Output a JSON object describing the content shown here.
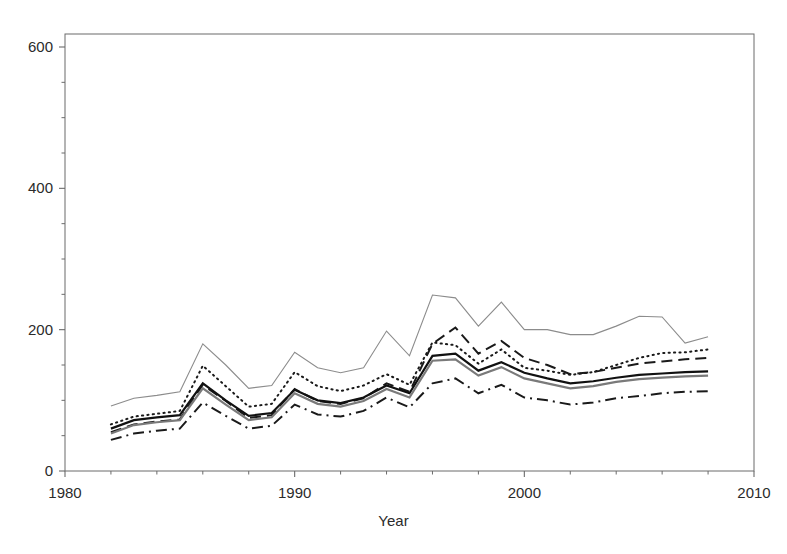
{
  "chart_data": {
    "type": "line",
    "title": "",
    "subtitle": "",
    "xlabel": "Year",
    "ylabel": "",
    "xlim": [
      1980,
      2010
    ],
    "ylim": [
      0,
      600
    ],
    "xticks": [
      1980,
      1990,
      2000,
      2010
    ],
    "xtick_labels": [
      "1980",
      "1990",
      "2000",
      "2010"
    ],
    "yticks": [
      0,
      200,
      400,
      600
    ],
    "ytick_labels": [
      "0",
      "200",
      "400",
      "600"
    ],
    "minor_ticks": true,
    "grid": false,
    "legend": "none",
    "x": [
      1982,
      1983,
      1984,
      1985,
      1986,
      1987,
      1988,
      1989,
      1990,
      1991,
      1992,
      1993,
      1994,
      1995,
      1996,
      1997,
      1998,
      1999,
      2000,
      2001,
      2002,
      2003,
      2004,
      2005,
      2006,
      2007,
      2008
    ],
    "series": [
      {
        "name": "series-1-thin-gray-solid",
        "style": "solid-thin-gray",
        "color": "#8c8c8c",
        "values": [
          92,
          103,
          107,
          112,
          180,
          150,
          117,
          121,
          168,
          146,
          139,
          146,
          198,
          163,
          249,
          245,
          205,
          239,
          200,
          200,
          193,
          193,
          205,
          219,
          218,
          181,
          190
        ]
      },
      {
        "name": "series-2-dotted",
        "style": "dotted",
        "color": "#1a1a1a",
        "values": [
          66,
          77,
          81,
          85,
          149,
          120,
          91,
          95,
          140,
          120,
          113,
          121,
          137,
          122,
          182,
          178,
          152,
          172,
          146,
          142,
          136,
          140,
          150,
          160,
          167,
          168,
          172
        ]
      },
      {
        "name": "series-3-dashed",
        "style": "dashed",
        "color": "#1a1a1a",
        "values": [
          55,
          66,
          70,
          73,
          122,
          99,
          75,
          79,
          116,
          99,
          95,
          103,
          124,
          112,
          180,
          203,
          166,
          184,
          160,
          150,
          137,
          140,
          146,
          152,
          155,
          158,
          160
        ]
      },
      {
        "name": "series-4-solid-black",
        "style": "solid-black",
        "color": "#111111",
        "values": [
          60,
          72,
          76,
          79,
          124,
          100,
          78,
          82,
          115,
          100,
          96,
          104,
          121,
          110,
          163,
          166,
          142,
          154,
          139,
          131,
          124,
          127,
          132,
          136,
          138,
          140,
          141
        ]
      },
      {
        "name": "series-5-solid-gray",
        "style": "solid-gray",
        "color": "#7a7a7a",
        "values": [
          53,
          65,
          69,
          72,
          117,
          94,
          72,
          76,
          110,
          95,
          91,
          99,
          116,
          104,
          156,
          158,
          135,
          147,
          131,
          124,
          117,
          120,
          126,
          130,
          132,
          134,
          135
        ]
      },
      {
        "name": "series-6-dash-dot",
        "style": "dash-dot",
        "color": "#1a1a1a",
        "values": [
          44,
          53,
          57,
          60,
          97,
          78,
          60,
          64,
          94,
          80,
          77,
          85,
          104,
          90,
          124,
          131,
          110,
          122,
          104,
          100,
          94,
          97,
          103,
          106,
          110,
          112,
          113
        ]
      }
    ]
  },
  "axes": {
    "frame_color": "#6b6b6b",
    "tick_color": "#6b6b6b",
    "background": "#ffffff"
  }
}
